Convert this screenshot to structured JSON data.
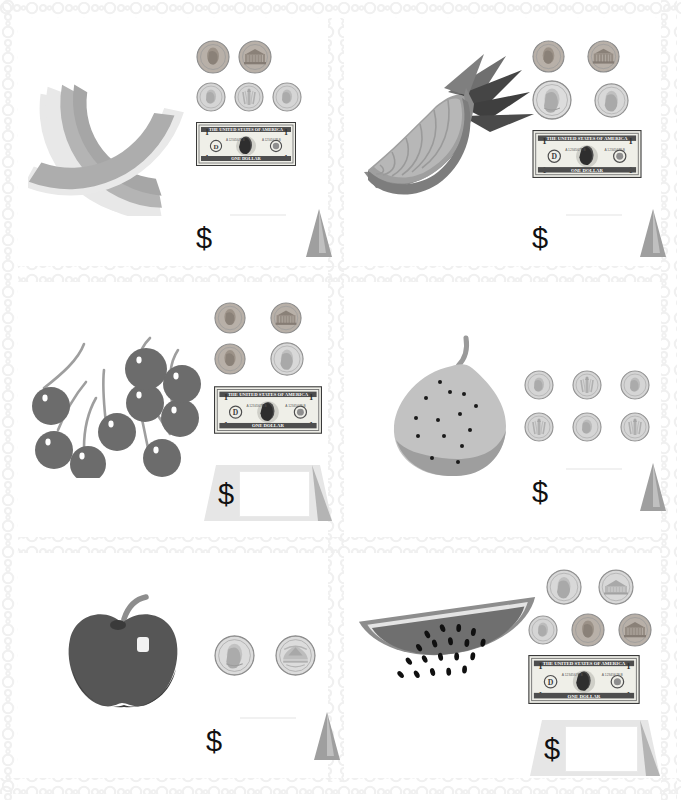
{
  "worksheet": {
    "title": "Counting Money with Fruit — Worksheet",
    "currency_symbol": "$",
    "border_style": "bead-chain",
    "background_color": "#ffffff",
    "divider_color": "#f0f0f0",
    "grid": {
      "columns": 2,
      "rows": 3
    }
  },
  "colors": {
    "melon_rind": "#e8e8e8",
    "melon_flesh": "#a8a8a8",
    "pineapple_flesh": "#b5b5b5",
    "pineapple_rind": "#8e8e8e",
    "pineapple_leaf_dark": "#4a4a4a",
    "pineapple_leaf_mid": "#7d7d7d",
    "cherry_body": "#6d6d6d",
    "cherry_stem": "#9a9a9a",
    "pear_body": "#c2c2c2",
    "pear_shadow": "#9c9c9c",
    "apple_body": "#585858",
    "apple_shadow": "#3c3c3c",
    "watermelon_flesh": "#6f6f6f",
    "watermelon_rind": "#8d8d8d",
    "watermelon_white": "#e4e4e4",
    "seed": "#151515",
    "coin_silver": "#c9c9c9",
    "coin_copper": "#a9a9a9",
    "triangle_gray": "#a6a6a6",
    "ink": "#111111"
  },
  "problems": [
    {
      "id": "problem-1",
      "index": 1,
      "fruit": "cantaloupe-slice",
      "fruit_label": "Cantaloupe slice",
      "coins": [
        {
          "name": "penny",
          "side": "heads",
          "label": "penny-heads",
          "value": 1
        },
        {
          "name": "penny",
          "side": "tails",
          "label": "penny-tails",
          "value": 1
        },
        {
          "name": "dime",
          "side": "heads",
          "label": "dime-heads",
          "value": 10
        },
        {
          "name": "dime",
          "side": "tails",
          "label": "dime-tails",
          "value": 10
        },
        {
          "name": "dime",
          "side": "heads",
          "label": "dime-heads",
          "value": 10
        }
      ],
      "bills": [
        {
          "name": "one-dollar-bill",
          "value": 100
        }
      ],
      "answer_value": "",
      "answer_box": false,
      "dollar_symbol": "$"
    },
    {
      "id": "problem-2",
      "index": 2,
      "fruit": "pineapple-slice",
      "fruit_label": "Pineapple slice",
      "coins": [
        {
          "name": "penny",
          "side": "heads",
          "label": "penny-heads",
          "value": 1
        },
        {
          "name": "penny",
          "side": "tails",
          "label": "penny-tails",
          "value": 1
        },
        {
          "name": "quarter",
          "side": "heads",
          "label": "quarter-heads",
          "value": 25
        },
        {
          "name": "nickel",
          "side": "heads",
          "label": "nickel-heads",
          "value": 5
        }
      ],
      "bills": [
        {
          "name": "one-dollar-bill",
          "value": 100
        }
      ],
      "answer_value": "",
      "answer_box": false,
      "dollar_symbol": "$"
    },
    {
      "id": "problem-3",
      "index": 3,
      "fruit": "cherries",
      "fruit_label": "Cherries",
      "fruit_count": 9,
      "coins": [
        {
          "name": "penny",
          "side": "heads",
          "label": "penny-heads",
          "value": 1
        },
        {
          "name": "penny",
          "side": "tails",
          "label": "penny-tails",
          "value": 1
        },
        {
          "name": "penny",
          "side": "heads",
          "label": "penny-heads",
          "value": 1
        },
        {
          "name": "nickel",
          "side": "heads",
          "label": "nickel-heads",
          "value": 5
        }
      ],
      "bills": [
        {
          "name": "one-dollar-bill",
          "value": 100
        }
      ],
      "answer_value": "",
      "answer_box": true,
      "dollar_symbol": "$"
    },
    {
      "id": "problem-4",
      "index": 4,
      "fruit": "pear",
      "fruit_label": "Pear",
      "coins": [
        {
          "name": "dime",
          "side": "heads",
          "label": "dime-heads",
          "value": 10
        },
        {
          "name": "dime",
          "side": "tails",
          "label": "dime-tails",
          "value": 10
        },
        {
          "name": "dime",
          "side": "heads",
          "label": "dime-heads",
          "value": 10
        },
        {
          "name": "dime",
          "side": "tails",
          "label": "dime-tails",
          "value": 10
        },
        {
          "name": "dime",
          "side": "heads",
          "label": "dime-heads",
          "value": 10
        },
        {
          "name": "dime",
          "side": "tails",
          "label": "dime-tails",
          "value": 10
        }
      ],
      "bills": [],
      "answer_value": "",
      "answer_box": false,
      "dollar_symbol": "$"
    },
    {
      "id": "problem-5",
      "index": 5,
      "fruit": "apple",
      "fruit_label": "Apple",
      "coins": [
        {
          "name": "quarter",
          "side": "heads",
          "label": "quarter-heads",
          "value": 25
        },
        {
          "name": "quarter",
          "side": "tails",
          "label": "quarter-tails",
          "value": 25
        }
      ],
      "bills": [],
      "answer_value": "",
      "answer_box": false,
      "dollar_symbol": "$"
    },
    {
      "id": "problem-6",
      "index": 6,
      "fruit": "watermelon-slice",
      "fruit_label": "Watermelon slice",
      "coins": [
        {
          "name": "nickel",
          "side": "heads",
          "label": "nickel-heads",
          "value": 5
        },
        {
          "name": "nickel",
          "side": "tails",
          "label": "nickel-tails",
          "value": 5
        },
        {
          "name": "dime",
          "side": "heads",
          "label": "dime-heads",
          "value": 10
        },
        {
          "name": "penny",
          "side": "heads",
          "label": "penny-heads",
          "value": 1
        },
        {
          "name": "penny",
          "side": "tails",
          "label": "penny-tails",
          "value": 1
        }
      ],
      "bills": [
        {
          "name": "one-dollar-bill",
          "value": 100
        }
      ],
      "answer_value": "",
      "answer_box": true,
      "dollar_symbol": "$"
    }
  ],
  "bill_text": {
    "top_line": "THE UNITED STATES OF AMERICA",
    "bottom_line": "ONE DOLLAR",
    "denomination": "1",
    "serial": "A 12345678 B"
  }
}
